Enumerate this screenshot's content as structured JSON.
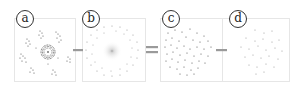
{
  "figure": {
    "panels": [
      {
        "id": "a",
        "label": "a",
        "description": "clustered point groups with a concentric ring cluster"
      },
      {
        "id": "b",
        "label": "b",
        "description": "radial ring of points with faint central glow"
      },
      {
        "id": "c",
        "label": "c",
        "description": "dense uniform point cloud"
      },
      {
        "id": "d",
        "label": "d",
        "description": "sparse uniform point cloud"
      }
    ],
    "operators": [
      {
        "between": [
          "a",
          "b"
        ],
        "symbol": "minus"
      },
      {
        "between": [
          "b",
          "c"
        ],
        "symbol": "equals"
      },
      {
        "between": [
          "c",
          "d"
        ],
        "symbol": "minus"
      }
    ],
    "colors": {
      "point": "#555555",
      "point_light": "#999999",
      "frame": "#e6e6e6",
      "operator": "#9a9a9a",
      "label_border": "#333333"
    }
  }
}
